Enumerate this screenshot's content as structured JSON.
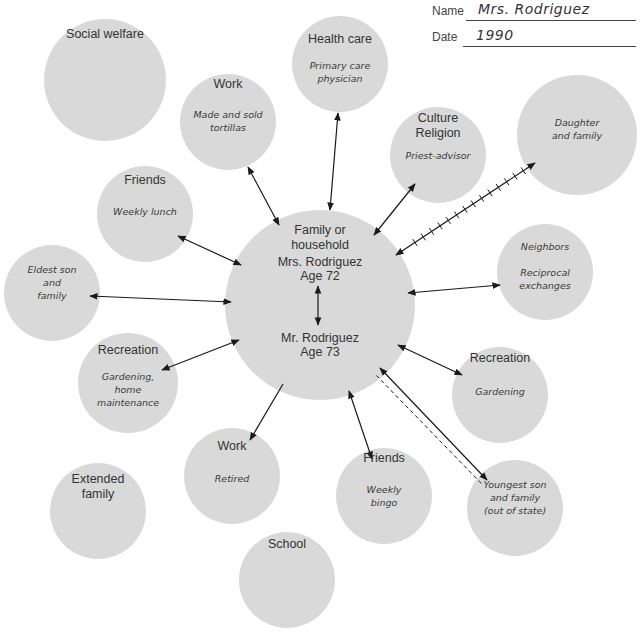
{
  "header": {
    "name_label": "Name",
    "name_value": "Mrs. Rodriguez",
    "date_label": "Date",
    "date_value": "1990"
  },
  "center": {
    "title_lines": [
      "Family or",
      "household"
    ],
    "person1_lines": [
      "Mrs. Rodriguez",
      "Age 72"
    ],
    "person2_lines": [
      "Mr. Rodriguez",
      "Age 73"
    ]
  },
  "nodes": [
    {
      "id": "social-welfare",
      "title": [
        "Social welfare"
      ],
      "sub": [],
      "connection": "none"
    },
    {
      "id": "work-tortillas",
      "title": [
        "Work"
      ],
      "sub": [
        "Made and sold",
        "tortillas"
      ],
      "connection": "bidirectional"
    },
    {
      "id": "health-care",
      "title": [
        "Health care"
      ],
      "sub": [
        "Primary care",
        "physician"
      ],
      "connection": "bidirectional"
    },
    {
      "id": "culture-religion",
      "title": [
        "Culture",
        "Religion"
      ],
      "sub": [
        "Priest-advisor"
      ],
      "connection": "bidirectional"
    },
    {
      "id": "daughter",
      "title": [],
      "sub": [
        "Daughter",
        "and family"
      ],
      "connection": "stressful-bidirectional"
    },
    {
      "id": "friends-lunch",
      "title": [
        "Friends"
      ],
      "sub": [
        "Weekly lunch"
      ],
      "connection": "bidirectional"
    },
    {
      "id": "eldest-son",
      "title": [],
      "sub": [
        "Eldest son",
        "and",
        "family"
      ],
      "connection": "bidirectional"
    },
    {
      "id": "neighbors",
      "title": [],
      "sub": [
        "Neighbors",
        "",
        "Reciprocal",
        "exchanges"
      ],
      "connection": "bidirectional"
    },
    {
      "id": "recreation-home",
      "title": [
        "Recreation"
      ],
      "sub": [
        "Gardening,",
        "home",
        "maintenance"
      ],
      "connection": "bidirectional"
    },
    {
      "id": "recreation-gardening",
      "title": [
        "Recreation"
      ],
      "sub": [
        "Gardening"
      ],
      "connection": "bidirectional"
    },
    {
      "id": "work-retired",
      "title": [
        "Work"
      ],
      "sub": [
        "Retired"
      ],
      "connection": "one-way-out"
    },
    {
      "id": "extended-family",
      "title": [
        "Extended",
        "family"
      ],
      "sub": [],
      "connection": "none"
    },
    {
      "id": "friends-bingo",
      "title": [
        "Friends"
      ],
      "sub": [
        "Weekly",
        "bingo"
      ],
      "connection": "bidirectional"
    },
    {
      "id": "youngest-son",
      "title": [],
      "sub": [
        "Youngest son",
        "and family",
        "(out of state)"
      ],
      "connection": "tenuous-bidirectional"
    },
    {
      "id": "school",
      "title": [
        "School"
      ],
      "sub": [],
      "connection": "none"
    }
  ],
  "colors": {
    "circle_fill": "#d9d9d9",
    "line": "#1a1a1a",
    "text": "#333333"
  }
}
